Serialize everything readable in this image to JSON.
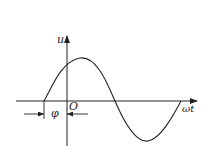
{
  "diagram": {
    "type": "sinusoid-phase",
    "labels": {
      "y_axis": "u",
      "x_axis": "ωt",
      "origin": "O",
      "phase": "φ"
    },
    "colors": {
      "stroke": "#222222",
      "background": "#ffffff"
    }
  }
}
